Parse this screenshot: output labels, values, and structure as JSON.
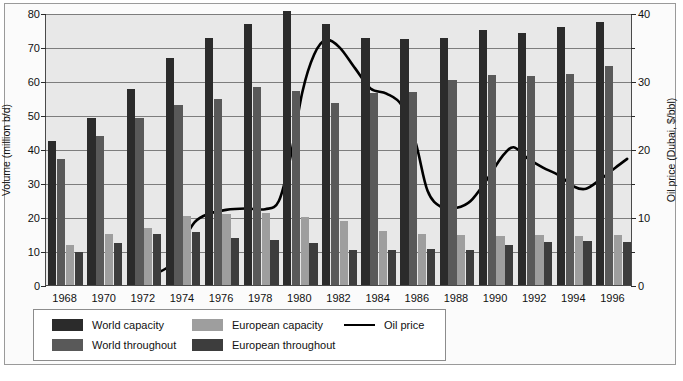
{
  "chart_data": {
    "type": "bar",
    "title": "",
    "subtitle": "",
    "xlabel": "",
    "ylabel": "Volume (million b/d)",
    "y2label": "Oil price (Dubai, $/bbl)",
    "grid": true,
    "legend_position": "bottom-left",
    "ylim": [
      0,
      80
    ],
    "y2lim": [
      0,
      40
    ],
    "yticks": [
      0,
      10,
      20,
      30,
      40,
      50,
      60,
      70,
      80
    ],
    "y2ticks": [
      0,
      10,
      20,
      30,
      40
    ],
    "y2minorticks": [
      5,
      15,
      25,
      35
    ],
    "categories": [
      "1968",
      "1970",
      "1972",
      "1974",
      "1976",
      "1978",
      "1980",
      "1982",
      "1984",
      "1986",
      "1988",
      "1990",
      "1992",
      "1994",
      "1996"
    ],
    "series": [
      {
        "name": "World capacity",
        "color": "#2b2b2b",
        "axis": "left",
        "values": [
          42.3,
          49.2,
          57.7,
          66.8,
          72.7,
          76.7,
          80.5,
          76.7,
          72.6,
          72.5,
          72.6,
          74.9,
          74.0,
          75.8,
          77.4
        ]
      },
      {
        "name": "World throughout",
        "color": "#595959",
        "axis": "left",
        "values": [
          37.2,
          43.9,
          49.0,
          53.0,
          54.6,
          58.2,
          57.0,
          53.6,
          56.5,
          56.8,
          60.3,
          61.7,
          61.4,
          62.0,
          64.3
        ]
      },
      {
        "name": "European capacity",
        "color": "#9e9e9e",
        "axis": "left",
        "values": [
          11.9,
          15.0,
          16.8,
          20.3,
          21.0,
          21.2,
          20.0,
          18.9,
          16.0,
          15.1,
          14.7,
          14.5,
          14.7,
          14.5,
          14.7
        ]
      },
      {
        "name": "European throughout",
        "color": "#3d3d3d",
        "axis": "left",
        "values": [
          9.8,
          12.3,
          15.0,
          15.6,
          13.9,
          13.3,
          12.5,
          10.2,
          10.2,
          10.5,
          10.4,
          11.8,
          12.6,
          12.8,
          12.6
        ]
      }
    ],
    "line_series": {
      "name": "Oil price",
      "color": "#000000",
      "axis": "right",
      "label": "Oil price (Dubai, $/bbl)",
      "points": [
        {
          "x": 1972.6,
          "y": 1.8
        },
        {
          "x": 1973.4,
          "y": 3.2
        },
        {
          "x": 1974.0,
          "y": 6.5
        },
        {
          "x": 1974.6,
          "y": 9.4
        },
        {
          "x": 1975.3,
          "y": 10.6
        },
        {
          "x": 1976.2,
          "y": 11.2
        },
        {
          "x": 1977.2,
          "y": 11.4
        },
        {
          "x": 1978.2,
          "y": 11.3
        },
        {
          "x": 1978.9,
          "y": 12.5
        },
        {
          "x": 1979.5,
          "y": 19.0
        },
        {
          "x": 1980.1,
          "y": 28.5
        },
        {
          "x": 1980.7,
          "y": 34.0
        },
        {
          "x": 1981.3,
          "y": 36.2
        },
        {
          "x": 1982.0,
          "y": 35.1
        },
        {
          "x": 1982.8,
          "y": 32.0
        },
        {
          "x": 1983.6,
          "y": 29.0
        },
        {
          "x": 1984.4,
          "y": 28.3
        },
        {
          "x": 1985.2,
          "y": 26.5
        },
        {
          "x": 1985.9,
          "y": 21.0
        },
        {
          "x": 1986.5,
          "y": 14.0
        },
        {
          "x": 1987.2,
          "y": 11.6
        },
        {
          "x": 1988.0,
          "y": 11.5
        },
        {
          "x": 1988.7,
          "y": 12.5
        },
        {
          "x": 1989.5,
          "y": 15.5
        },
        {
          "x": 1990.3,
          "y": 19.0
        },
        {
          "x": 1990.9,
          "y": 20.4
        },
        {
          "x": 1991.6,
          "y": 18.8
        },
        {
          "x": 1992.4,
          "y": 17.4
        },
        {
          "x": 1993.2,
          "y": 16.3
        },
        {
          "x": 1994.0,
          "y": 14.6
        },
        {
          "x": 1994.6,
          "y": 14.3
        },
        {
          "x": 1995.3,
          "y": 15.6
        },
        {
          "x": 1996.1,
          "y": 17.4
        },
        {
          "x": 1996.7,
          "y": 18.7
        }
      ]
    }
  },
  "axes": {
    "left": {
      "label": "Volume (million b/d)",
      "ticks": [
        "0",
        "10",
        "20",
        "30",
        "40",
        "50",
        "60",
        "70",
        "80"
      ]
    },
    "right": {
      "label": "Oil price (Dubai, $/bbl)",
      "ticks": [
        "0",
        "10",
        "20",
        "30",
        "40"
      ]
    },
    "x": {
      "ticks": [
        "1968",
        "1970",
        "1972",
        "1974",
        "1976",
        "1978",
        "1980",
        "1982",
        "1984",
        "1986",
        "1988",
        "1990",
        "1992",
        "1994",
        "1996"
      ]
    }
  },
  "legend": {
    "items": [
      {
        "label": "World capacity",
        "color": "#2b2b2b",
        "kind": "swatch"
      },
      {
        "label": "European capacity",
        "color": "#9e9e9e",
        "kind": "swatch"
      },
      {
        "label": "Oil price",
        "color": "#000000",
        "kind": "line"
      },
      {
        "label": "World throughout",
        "color": "#595959",
        "kind": "swatch"
      },
      {
        "label": "European throughout",
        "color": "#3d3d3d",
        "kind": "swatch"
      }
    ]
  }
}
